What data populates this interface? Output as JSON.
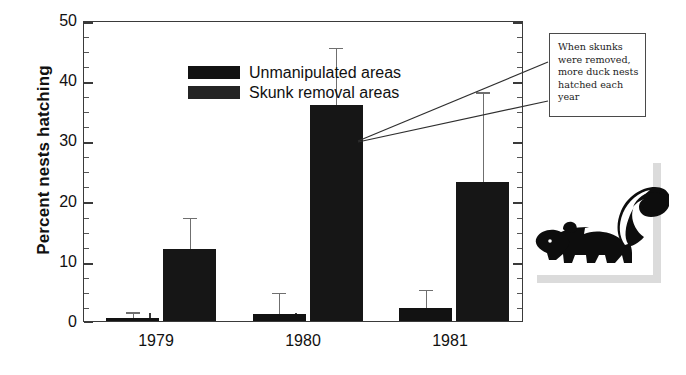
{
  "chart_data": {
    "type": "bar",
    "title": "",
    "xlabel": "",
    "ylabel": "Percent nests hatching",
    "categories": [
      "1979",
      "1980",
      "1981"
    ],
    "ylim": [
      0,
      50
    ],
    "ytick_labels": [
      "0",
      "10",
      "20",
      "30",
      "40",
      "50"
    ],
    "ytick_values": [
      0,
      10,
      20,
      30,
      40,
      50
    ],
    "ytick_minor_step": 2.5,
    "grid": false,
    "legend_position": "inside-top-left",
    "series": [
      {
        "name": "Unmanipulated areas",
        "color": "#121212",
        "values": [
          0.5,
          1.2,
          2.2
        ],
        "error_high": [
          1.2,
          4.5,
          5.0
        ]
      },
      {
        "name": "Skunk removal areas",
        "color": "#161616",
        "values": [
          12.0,
          36.2,
          23.3
        ],
        "error_high": [
          17.0,
          45.5,
          38.0
        ]
      }
    ],
    "annotations": [
      {
        "text": "When skunks were removed, more duck nests hatched each year",
        "lines": [
          "When skunks",
          "were removed,",
          "more duck nests",
          "hatched each",
          "year"
        ],
        "target": "1980 and 1981 skunk removal bars"
      }
    ]
  },
  "legend": {
    "items": [
      {
        "label": "Unmanipulated areas",
        "color": "#121212",
        "swatch": "legend-swatch-unmanipulated"
      },
      {
        "label": "Skunk removal areas",
        "color": "#161616",
        "swatch": "legend-swatch-skunk-removal"
      }
    ]
  },
  "axes": {
    "y_title": "Percent nests hatching",
    "y_ticks": [
      "50",
      "40",
      "30",
      "20",
      "10",
      "0"
    ],
    "x_ticks": [
      "1979",
      "1980",
      "1981"
    ]
  },
  "callout": {
    "line1": "When skunks",
    "line2": "were removed,",
    "line3": "more duck nests",
    "line4": "hatched each",
    "line5": "year"
  },
  "illustration": {
    "name": "skunk-illustration",
    "alt": "Skunk silhouette"
  },
  "colors": {
    "bar_unmanipulated": "#121212",
    "bar_skunk_removal": "#161616",
    "error_bar": "#6f6f6f",
    "axis": "#3a3a3a",
    "background": "#ffffff",
    "callout_border": "#4a4a4a"
  }
}
